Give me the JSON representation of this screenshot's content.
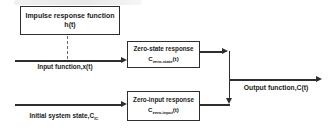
{
  "diagram": {
    "background": "#ffffff",
    "line_color": "#2e2e2e",
    "text_color": "#1c1c1c",
    "impulse_box": {
      "line1": "Impulse response function",
      "line2": "h(t)"
    },
    "zero_state_box": {
      "title": "Zero-state response",
      "symbol_base": "C",
      "symbol_sub": "zero-state",
      "symbol_arg": "(t)"
    },
    "zero_input_box": {
      "title": "Zero-input response",
      "symbol_base": "C",
      "symbol_sub": "zero-input",
      "symbol_arg": "(t)"
    },
    "labels": {
      "input": "Input function,x(t)",
      "initial_state_base": "Initial system state,C",
      "initial_state_sub": "IC",
      "output": "Output function,C(t)"
    }
  }
}
